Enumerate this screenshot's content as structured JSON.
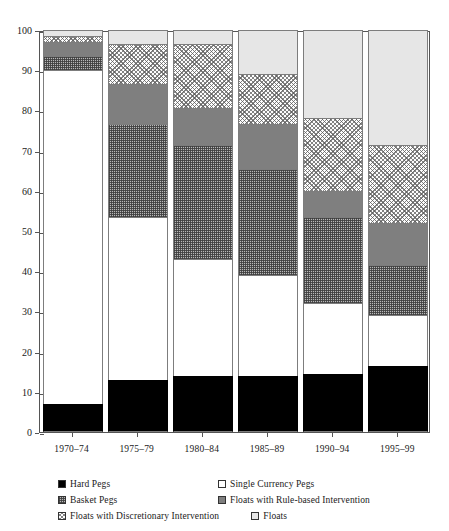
{
  "chart_data": {
    "type": "bar",
    "subtype": "stacked-bar-100-percent",
    "title": "",
    "xlabel": "",
    "ylabel": "",
    "ylim": [
      0,
      100
    ],
    "yticks": [
      0,
      10,
      20,
      30,
      40,
      50,
      60,
      70,
      80,
      90,
      100
    ],
    "grid": false,
    "legend_position": "bottom",
    "categories": [
      "1970–74",
      "1975–79",
      "1980–84",
      "1985–89",
      "1990–94",
      "1995–99"
    ],
    "series": [
      {
        "name": "Hard Pegs",
        "key": "hard-pegs",
        "values": [
          7.0,
          13.0,
          14.0,
          14.0,
          14.5,
          16.5
        ]
      },
      {
        "name": "Single Currency Pegs",
        "key": "single-currency-pegs",
        "values": [
          83.0,
          40.5,
          29.0,
          25.0,
          17.5,
          12.5
        ]
      },
      {
        "name": "Basket Pegs",
        "key": "basket-pegs",
        "values": [
          3.5,
          23.0,
          28.5,
          26.5,
          21.5,
          12.5
        ]
      },
      {
        "name": "Floats with Rule-based Intervention",
        "key": "rule-based",
        "values": [
          3.5,
          10.0,
          9.0,
          11.0,
          6.5,
          10.5
        ]
      },
      {
        "name": "Floats with  Discretionary Intervention",
        "key": "discretionary",
        "values": [
          1.5,
          10.0,
          16.0,
          12.5,
          18.0,
          19.5
        ]
      },
      {
        "name": "Floats",
        "key": "floats",
        "values": [
          1.5,
          3.5,
          3.5,
          11.0,
          22.0,
          28.5
        ]
      }
    ],
    "colors": {
      "hard-pegs": "#000000",
      "single-currency-pegs": "#ffffff",
      "basket-pegs": "#b8b8b8",
      "rule-based": "#7f7f7f",
      "discretionary": "#fdfdfd",
      "floats": "#e6e6e6",
      "axis": "#555555",
      "text": "#1a1a1a"
    }
  },
  "legend": {
    "rows": [
      [
        {
          "label": "Hard Pegs",
          "key": "hard-pegs"
        },
        {
          "label": "Single Currency Pegs",
          "key": "single-currency-pegs"
        }
      ],
      [
        {
          "label": "Basket Pegs",
          "key": "basket-pegs"
        },
        {
          "label": "Floats with Rule-based Intervention",
          "key": "rule-based"
        }
      ],
      [
        {
          "label": "Floats with  Discretionary Intervention",
          "key": "discretionary"
        },
        {
          "label": "Floats",
          "key": "floats"
        }
      ]
    ]
  }
}
